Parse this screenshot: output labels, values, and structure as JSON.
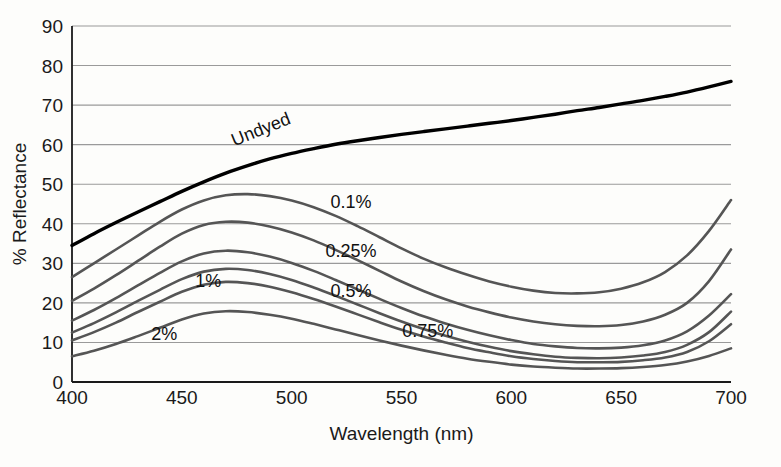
{
  "chart_data": {
    "type": "line",
    "title": "",
    "xlabel": "Wavelength (nm)",
    "ylabel": "% Reflectance",
    "xlim": [
      400,
      700
    ],
    "ylim": [
      0,
      90
    ],
    "grid": true,
    "legend_position": "inline-annotations",
    "xticks": [
      "400",
      "450",
      "500",
      "550",
      "600",
      "650",
      "700"
    ],
    "yticks": [
      "0",
      "10",
      "20",
      "30",
      "40",
      "50",
      "60",
      "70",
      "80",
      "90"
    ],
    "x": [
      400,
      410,
      420,
      430,
      440,
      450,
      460,
      470,
      480,
      490,
      500,
      510,
      520,
      530,
      540,
      550,
      560,
      570,
      580,
      590,
      600,
      610,
      620,
      630,
      640,
      650,
      660,
      670,
      680,
      690,
      700
    ],
    "series": [
      {
        "name": "Undyed",
        "label": "Undyed",
        "color": "#000000",
        "width": 3.4,
        "values": [
          34.5,
          37.5,
          40.3,
          43.0,
          45.6,
          48.2,
          50.6,
          52.8,
          54.7,
          56.4,
          57.8,
          59.0,
          60.1,
          61.0,
          61.8,
          62.6,
          63.3,
          64.0,
          64.7,
          65.4,
          66.1,
          66.9,
          67.7,
          68.6,
          69.4,
          70.3,
          71.2,
          72.2,
          73.3,
          74.6,
          76.0
        ]
      },
      {
        "name": "0.1%",
        "label": "0.1%",
        "color": "#555555",
        "width": 2.6,
        "values": [
          26.5,
          30.0,
          33.5,
          37.0,
          40.5,
          43.6,
          45.9,
          47.2,
          47.5,
          47.0,
          45.9,
          44.2,
          42.0,
          39.4,
          36.6,
          33.8,
          31.2,
          29.0,
          27.1,
          25.4,
          24.1,
          23.1,
          22.5,
          22.4,
          22.7,
          23.6,
          25.2,
          27.8,
          32.0,
          38.2,
          46.0
        ]
      },
      {
        "name": "0.25%",
        "label": "0.25%",
        "color": "#555555",
        "width": 2.6,
        "values": [
          20.5,
          23.6,
          27.0,
          30.6,
          34.2,
          37.5,
          39.7,
          40.5,
          40.3,
          39.3,
          37.8,
          35.8,
          33.4,
          30.8,
          28.1,
          25.4,
          23.0,
          20.9,
          19.1,
          17.6,
          16.3,
          15.3,
          14.6,
          14.2,
          14.1,
          14.4,
          15.3,
          17.0,
          20.0,
          25.5,
          33.5
        ]
      },
      {
        "name": "0.5%",
        "label": "0.5%",
        "color": "#555555",
        "width": 2.6,
        "values": [
          15.5,
          18.2,
          21.2,
          24.4,
          27.6,
          30.5,
          32.5,
          33.2,
          32.8,
          31.7,
          30.1,
          28.1,
          25.8,
          23.4,
          21.0,
          18.7,
          16.6,
          14.8,
          13.2,
          11.8,
          10.6,
          9.6,
          9.0,
          8.6,
          8.5,
          8.7,
          9.3,
          10.5,
          12.8,
          16.8,
          22.2
        ]
      },
      {
        "name": "0.75%",
        "label": "0.75%",
        "color": "#555555",
        "width": 2.6,
        "values": [
          12.5,
          14.9,
          17.6,
          20.5,
          23.3,
          26.0,
          27.9,
          28.6,
          28.3,
          27.3,
          25.8,
          23.9,
          21.8,
          19.6,
          17.4,
          15.3,
          13.4,
          11.7,
          10.2,
          8.9,
          7.8,
          7.0,
          6.4,
          6.1,
          6.0,
          6.2,
          6.7,
          7.6,
          9.4,
          12.6,
          17.8
        ]
      },
      {
        "name": "1%",
        "label": "1%",
        "color": "#555555",
        "width": 2.6,
        "values": [
          10.5,
          12.6,
          15.0,
          17.7,
          20.3,
          22.8,
          24.6,
          25.3,
          25.0,
          24.1,
          22.7,
          21.0,
          19.1,
          17.1,
          15.1,
          13.2,
          11.5,
          10.0,
          8.6,
          7.5,
          6.5,
          5.8,
          5.3,
          5.0,
          5.0,
          5.1,
          5.5,
          6.2,
          7.6,
          10.3,
          14.6
        ]
      },
      {
        "name": "2%",
        "label": "2%",
        "color": "#555555",
        "width": 2.6,
        "values": [
          6.5,
          7.9,
          9.6,
          11.6,
          13.7,
          15.8,
          17.3,
          17.9,
          17.7,
          17.0,
          16.0,
          14.7,
          13.3,
          11.9,
          10.5,
          9.2,
          8.0,
          6.9,
          5.9,
          5.1,
          4.4,
          3.9,
          3.6,
          3.4,
          3.4,
          3.5,
          3.8,
          4.3,
          5.2,
          6.6,
          8.5
        ]
      }
    ],
    "annotations": [
      {
        "text": "Undyed",
        "x": 487,
        "y": 62.5,
        "rotation": -22
      },
      {
        "text": "0.1%",
        "x": 527,
        "y": 44.0,
        "rotation": 0
      },
      {
        "text": "0.25%",
        "x": 527,
        "y": 31.5,
        "rotation": 0
      },
      {
        "text": "0.5%",
        "x": 527,
        "y": 21.5,
        "rotation": 0
      },
      {
        "text": "0.75%",
        "x": 562,
        "y": 11.5,
        "rotation": 0
      },
      {
        "text": "1%",
        "x": 462,
        "y": 24.0,
        "rotation": 0
      },
      {
        "text": "2%",
        "x": 442,
        "y": 10.5,
        "rotation": 0
      }
    ],
    "colors": {
      "background": "#fdfdfb",
      "grid": "#9a9a9a",
      "axis": "#1a1a1a",
      "curve_gray": "#555555",
      "curve_black": "#000000"
    }
  }
}
